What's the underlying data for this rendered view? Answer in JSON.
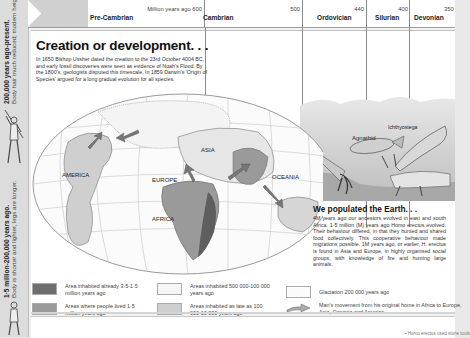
{
  "timeline": {
    "periods": [
      {
        "name": "Pre-Cambrian",
        "age_label": "Million years ago 600"
      },
      {
        "name": "Cambrian",
        "age_label": "500"
      },
      {
        "name": "Ordovician",
        "age_label": "440"
      },
      {
        "name": "Silurian",
        "age_label": "400"
      },
      {
        "name": "Devonian",
        "age_label": "350"
      }
    ]
  },
  "sidebar": {
    "top_caption": {
      "heading": "200,000 years ago-present.",
      "text": "Body hair much reduced; modern height achieved."
    },
    "bottom_caption": {
      "heading": "1·5 million-200,000 years ago.",
      "text": "Body is shorter and lighter, legs are longer."
    }
  },
  "main": {
    "title": "Creation or development. . .",
    "intro": "In 1650 Bishop Ussher dated the creation to the 23rd October 4004 BC, and early fossil discoveries were seen as evidence of Noah's Flood. By the 1800's, geologists disputed this timescale. In 1859 Darwin's 'Origin of Species' argued for a long gradual evolution for all species."
  },
  "map": {
    "labels": [
      "AMERICA",
      "EUROPE",
      "ASIA",
      "AFRICA",
      "OCEANIA"
    ]
  },
  "scene": {
    "labels": [
      "Agnathid",
      "Ichthyostega"
    ]
  },
  "populated": {
    "title": "We populated the Earth. . .",
    "text": "4M years ago our ancestors evolved in east and south Africa. 1·5 million (M) years ago Homo erectus evolved. Their behaviour differed, in that they hunted and shared food collectively. This cooperative behaviour made migrations possible. 1M years ago, or earlier, H. erectus is found in Asia and Europe, in highly organised social groups, with knowledge of fire and hunting large animals."
  },
  "legend": {
    "items": [
      {
        "text": "Area inhabited already 3·5-1·5 million years ago",
        "color": "#6e6e6e"
      },
      {
        "text": "Areas where people lived 1·5 million years ago",
        "color": "#9a9a9a"
      },
      {
        "text": "Areas inhabited 500 000-100 000 years ago",
        "color": "#f6f6f6"
      },
      {
        "text": "Areas inhabited as late as 100 000-10 000 years ago",
        "color": "#cfcfcf"
      },
      {
        "text": "Glaciation 200 000 years ago",
        "color": "#fbfbfb"
      },
      {
        "text": "Man's movement from his original home in Africa to Europe, Asia, Oceania and America",
        "icon": "arrow-icon"
      }
    ]
  },
  "footer": {
    "note": "▪ Homo erectus used stone tools"
  }
}
